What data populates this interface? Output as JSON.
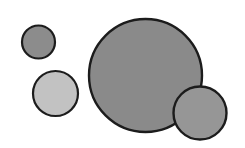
{
  "canvas": {
    "width": 245,
    "height": 148,
    "background": "#ffffff"
  },
  "circles": [
    {
      "id": "small-top-left",
      "cx": 38.5,
      "cy": 42,
      "r": 16.5,
      "fill": "#8c8c8c",
      "stroke": "#1c1c1c",
      "stroke_width": 2.2
    },
    {
      "id": "light-left",
      "cx": 55.5,
      "cy": 93.5,
      "r": 22.5,
      "fill": "#c2c2c2",
      "stroke": "#1c1c1c",
      "stroke_width": 2.2
    },
    {
      "id": "large-center",
      "cx": 145.5,
      "cy": 75.5,
      "r": 56.5,
      "fill": "#8a8a8a",
      "stroke": "#1c1c1c",
      "stroke_width": 2.4
    },
    {
      "id": "medium-right",
      "cx": 200,
      "cy": 113,
      "r": 26.5,
      "fill": "#969696",
      "stroke": "#1c1c1c",
      "stroke_width": 2.4
    }
  ]
}
